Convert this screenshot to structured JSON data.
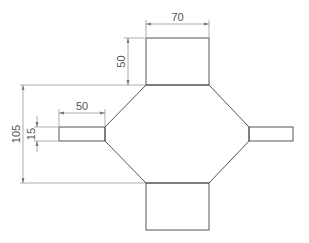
{
  "drawing": {
    "description": "Technical drawing of a symmetric octagonal manifold with two large rectangular ports (top and bottom) and two small rectangular ports (left and right)",
    "line_color": "#555555",
    "dimension_color": "#777777",
    "dimensions": {
      "top_port_width": "70",
      "top_port_height": "50",
      "overall_body_height": "105",
      "side_port_length": "50",
      "side_port_height": "15"
    }
  }
}
